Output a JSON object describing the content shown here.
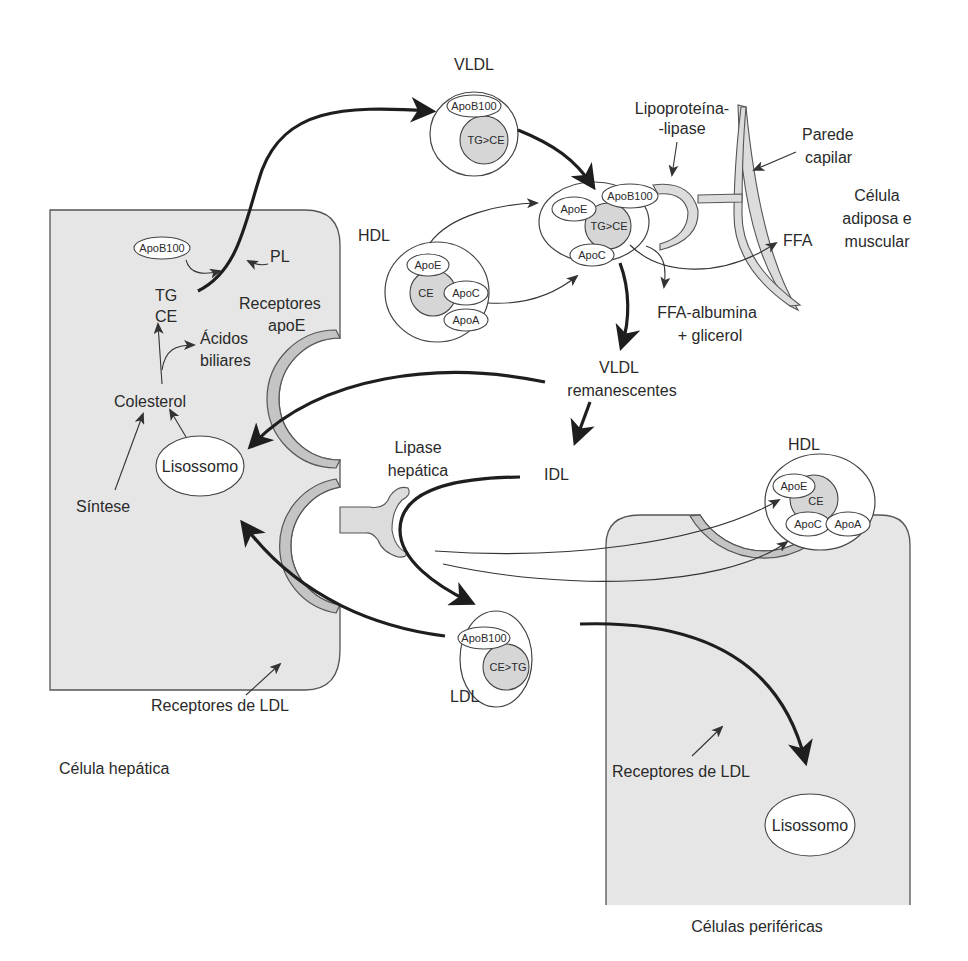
{
  "diagram": {
    "colors": {
      "cell_fill": "#e6e6e6",
      "receptor_fill": "#c4c4c4",
      "core_fill": "#d6d6d6",
      "line": "#1e1e1e"
    },
    "liver_cell": {
      "label": "Célula hepática",
      "apob100": "ApoB100",
      "pl": "PL",
      "tg": "TG",
      "ce": "CE",
      "receptores_apoe_1": "Receptores",
      "receptores_apoe_2": "apoE",
      "acidos_1": "Ácidos",
      "acidos_2": "biliares",
      "colesterol": "Colesterol",
      "lisossomo": "Lisossomo",
      "sintese": "Síntese",
      "receptores_ldl": "Receptores de LDL"
    },
    "lipase_hepatica": {
      "line1": "Lipase",
      "line2": "hepática"
    },
    "vldl": {
      "label": "VLDL",
      "apo": "ApoB100",
      "core": "TG>CE"
    },
    "vldl_active": {
      "apob100": "ApoB100",
      "apoe": "ApoE",
      "core": "TG>CE",
      "apoc": "ApoC"
    },
    "hdl_left": {
      "label": "HDL",
      "apoe": "ApoE",
      "core": "CE",
      "apoc": "ApoC",
      "apoa": "ApoA"
    },
    "hdl_right": {
      "label": "HDL",
      "apoe": "ApoE",
      "core": "CE",
      "apoc": "ApoC",
      "apoa": "ApoA"
    },
    "lpl": {
      "line1": "Lipoproteína-",
      "line2": "-lipase"
    },
    "capillary": {
      "line1": "Parede",
      "line2": "capilar"
    },
    "adipose": {
      "line1": "Célula",
      "line2": "adiposa e",
      "line3": "muscular"
    },
    "ffa": "FFA",
    "ffa_albumin": {
      "line1": "FFA-albumina",
      "line2": "+ glicerol"
    },
    "vldl_remnants": {
      "line1": "VLDL",
      "line2": "remanescentes"
    },
    "idl": "IDL",
    "ldl": {
      "label": "LDL",
      "apo": "ApoB100",
      "core": "CE>TG"
    },
    "peripheral_cell": {
      "label": "Células periféricas",
      "receptores_ldl": "Receptores de LDL",
      "lisossomo": "Lisossomo"
    }
  }
}
